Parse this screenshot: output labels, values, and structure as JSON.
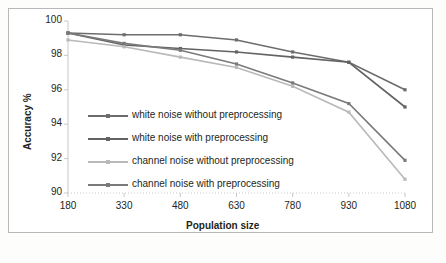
{
  "chart_data": {
    "type": "line",
    "title": "",
    "xlabel": "Population size",
    "ylabel": "Accuracy %",
    "x": [
      180,
      330,
      480,
      630,
      780,
      930,
      1080
    ],
    "xticklabels": [
      "180",
      "330",
      "480",
      "630",
      "780",
      "930",
      "1080"
    ],
    "yticklabels": [
      "90",
      "92",
      "94",
      "96",
      "98",
      "100"
    ],
    "yticks": [
      90,
      92,
      94,
      96,
      98,
      100
    ],
    "xlim": [
      180,
      1080
    ],
    "ylim": [
      90,
      100
    ],
    "grid": false,
    "legend_position": "inside lower-left",
    "series": [
      {
        "name": "white noise without preprocessing",
        "color": "#6d6d6d",
        "values": [
          99.3,
          99.2,
          99.2,
          98.9,
          98.2,
          97.6,
          96.0
        ]
      },
      {
        "name": "white noise with preprocessing",
        "color": "#636363",
        "values": [
          99.3,
          98.6,
          98.4,
          98.2,
          97.9,
          97.6,
          95.0
        ]
      },
      {
        "name": "channel noise without preprocessing",
        "color": "#b9b9b9",
        "values": [
          98.9,
          98.5,
          97.9,
          97.3,
          96.2,
          94.7,
          90.8
        ]
      },
      {
        "name": "channel noise with preprocessing",
        "color": "#7a7a7a",
        "values": [
          99.3,
          98.7,
          98.3,
          97.5,
          96.4,
          95.2,
          91.9
        ]
      }
    ]
  },
  "legend": {
    "items": [
      "white noise without preprocessing",
      "white noise with preprocessing",
      "channel noise without preprocessing",
      "channel noise with preprocessing"
    ]
  }
}
